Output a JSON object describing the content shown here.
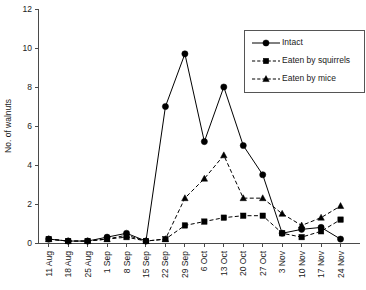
{
  "chart_data": {
    "type": "line",
    "title": "",
    "xlabel": "",
    "ylabel": "No. of walnuts",
    "ylim": [
      0,
      12
    ],
    "yticks": [
      0,
      2,
      4,
      6,
      8,
      10,
      12
    ],
    "grid": false,
    "legend_position": "top-right",
    "categories": [
      "11 Aug",
      "18 Aug",
      "25 Aug",
      "1 Sep",
      "8 Sep",
      "15 Sep",
      "22 Sep",
      "29 Sep",
      "6 Oct",
      "13 Oct",
      "20 Oct",
      "27 Oct",
      "3 Nov",
      "10 Nov",
      "17 Nov",
      "24 Nov"
    ],
    "series": [
      {
        "name": "Intact",
        "marker": "circle",
        "line_style": "solid",
        "color": "#000000",
        "values": [
          0.2,
          0.1,
          0.1,
          0.3,
          0.5,
          0.1,
          7.0,
          9.7,
          5.2,
          8.0,
          5.0,
          3.5,
          0.5,
          0.7,
          0.8,
          0.2
        ]
      },
      {
        "name": "Eaten by squirrels",
        "marker": "square",
        "line_style": "dashed",
        "color": "#000000",
        "values": [
          0.2,
          0.1,
          0.1,
          0.2,
          0.3,
          0.1,
          0.2,
          0.9,
          1.1,
          1.3,
          1.4,
          1.4,
          0.5,
          0.3,
          0.6,
          1.2
        ]
      },
      {
        "name": "Eaten by mice",
        "marker": "triangle",
        "line_style": "dashed",
        "color": "#000000",
        "values": [
          0.2,
          0.1,
          0.1,
          0.2,
          0.4,
          0.1,
          0.2,
          2.3,
          3.3,
          4.5,
          2.3,
          2.3,
          1.5,
          0.9,
          1.3,
          1.9
        ]
      }
    ]
  },
  "legend": {
    "entries": [
      {
        "label": "Intact"
      },
      {
        "label": "Eaten by squirrels"
      },
      {
        "label": "Eaten by mice"
      }
    ]
  }
}
